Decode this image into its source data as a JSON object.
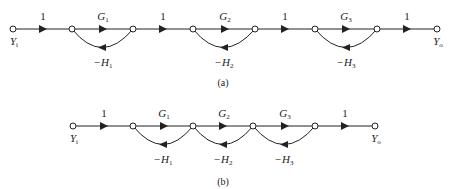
{
  "diagrams": [
    {
      "id": "a",
      "caption": "(a)",
      "input_label": {
        "base": "Y",
        "sub": "i"
      },
      "output_label": {
        "base": "Y",
        "sub": "o"
      },
      "forward_branches": [
        {
          "label": "1",
          "from": 0,
          "to": 1
        },
        {
          "label": "G",
          "sub": "1",
          "from": 1,
          "to": 2
        },
        {
          "label": "1",
          "from": 2,
          "to": 3
        },
        {
          "label": "G",
          "sub": "2",
          "from": 3,
          "to": 4
        },
        {
          "label": "1",
          "from": 4,
          "to": 5
        },
        {
          "label": "G",
          "sub": "3",
          "from": 5,
          "to": 6
        },
        {
          "label": "1",
          "from": 6,
          "to": 7
        }
      ],
      "feedback_branches": [
        {
          "label": "−H",
          "sub": "1",
          "from": 2,
          "to": 1
        },
        {
          "label": "−H",
          "sub": "2",
          "from": 4,
          "to": 3
        },
        {
          "label": "−H",
          "sub": "3",
          "from": 6,
          "to": 5
        }
      ]
    },
    {
      "id": "b",
      "caption": "(b)",
      "input_label": {
        "base": "Y",
        "sub": "i"
      },
      "output_label": {
        "base": "Y",
        "sub": "o"
      },
      "forward_branches": [
        {
          "label": "1",
          "from": 0,
          "to": 1
        },
        {
          "label": "G",
          "sub": "1",
          "from": 1,
          "to": 2
        },
        {
          "label": "G",
          "sub": "2",
          "from": 2,
          "to": 3
        },
        {
          "label": "G",
          "sub": "3",
          "from": 3,
          "to": 4
        },
        {
          "label": "1",
          "from": 4,
          "to": 5
        }
      ],
      "feedback_branches": [
        {
          "label": "−H",
          "sub": "1",
          "from": 2,
          "to": 1
        },
        {
          "label": "−H",
          "sub": "2",
          "from": 3,
          "to": 2
        },
        {
          "label": "−H",
          "sub": "3",
          "from": 4,
          "to": 3
        }
      ]
    }
  ]
}
